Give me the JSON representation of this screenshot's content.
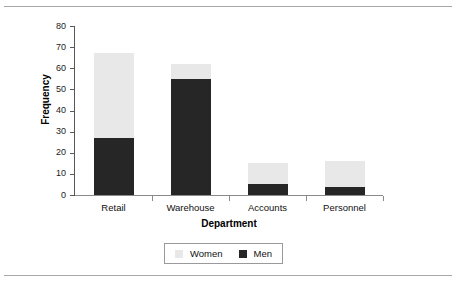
{
  "chart_data": {
    "type": "bar",
    "subtype": "stacked-bar",
    "title": "",
    "xlabel": "Department",
    "ylabel": "Frequency",
    "categories": [
      "Retail",
      "Warehouse",
      "Accounts",
      "Personnel"
    ],
    "series": [
      {
        "name": "Men",
        "values": [
          27,
          55,
          5,
          4
        ],
        "color": "#262626"
      },
      {
        "name": "Women",
        "values": [
          40,
          7,
          10,
          12
        ],
        "color": "#e8e8e8"
      }
    ],
    "totals": [
      67,
      62,
      15,
      16
    ],
    "ylim": [
      0,
      80
    ],
    "yticks": [
      0,
      10,
      20,
      30,
      40,
      50,
      60,
      70,
      80
    ],
    "ytick_labels": [
      "0",
      "10",
      "20",
      "30",
      "40",
      "50",
      "60",
      "70",
      "80"
    ],
    "grid": false,
    "legend_position": "bottom-center",
    "legend_order": [
      "Women",
      "Men"
    ],
    "stack_order_bottom_to_top": [
      "Men",
      "Women"
    ]
  },
  "legend": {
    "items": [
      {
        "label": "Women",
        "color": "#e8e8e8"
      },
      {
        "label": "Men",
        "color": "#262626"
      }
    ]
  },
  "axes": {
    "x_title": "Department",
    "y_title": "Frequency"
  },
  "colors": {
    "women": "#e8e8e8",
    "men": "#262626",
    "axis": "#58585a",
    "rule": "#a8a8ac",
    "text": "#111111"
  }
}
